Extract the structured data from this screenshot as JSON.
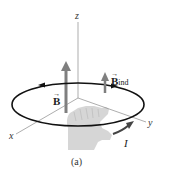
{
  "figure": {
    "caption": "(a)",
    "axes": {
      "z_label": "z",
      "x_label": "x",
      "y_label": "y"
    },
    "vectors": {
      "b_field": {
        "symbol": "B",
        "arrow": "→",
        "color": "#808080"
      },
      "b_induced": {
        "symbol": "B",
        "subscript": "ind",
        "arrow": "→",
        "color": "#808080"
      }
    },
    "current": {
      "symbol": "I",
      "color": "#444444"
    },
    "loop": {
      "color": "#111111",
      "direction": "counterclockwise-viewed-from-above"
    },
    "hand": {
      "description": "right hand (curled fingers, thumb up)",
      "color": "#d3d3d3"
    }
  }
}
